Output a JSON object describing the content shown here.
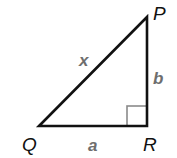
{
  "diagram": {
    "type": "right-triangle",
    "colors": {
      "edge": "#111111",
      "right_angle_marker": "#8a8a8a",
      "vertex_label": "#111111",
      "side_label": "#6e6e6e"
    },
    "vertices": [
      {
        "id": "P",
        "label": "P",
        "x": 147,
        "y": 17
      },
      {
        "id": "Q",
        "label": "Q",
        "x": 39,
        "y": 126
      },
      {
        "id": "R",
        "label": "R",
        "x": 147,
        "y": 126
      }
    ],
    "sides": [
      {
        "from": "Q",
        "to": "P",
        "label": "x"
      },
      {
        "from": "P",
        "to": "R",
        "label": "b"
      },
      {
        "from": "Q",
        "to": "R",
        "label": "a"
      }
    ],
    "right_angle_at": "R"
  }
}
